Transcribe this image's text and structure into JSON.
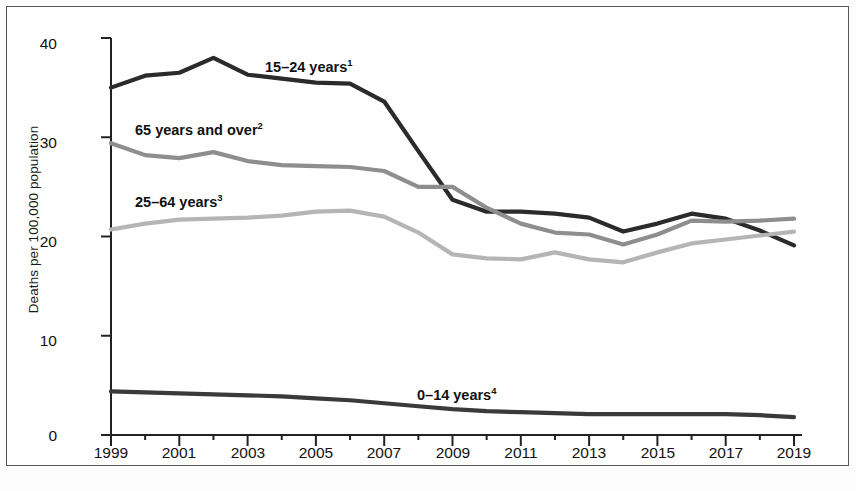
{
  "figure": {
    "background_color": "#ffffff",
    "border_color": "#555555"
  },
  "axis": {
    "ylabel": "Deaths per 100,000 population",
    "y_ticks": [
      "0",
      "10",
      "20",
      "30",
      "40"
    ],
    "x_ticks_labeled": [
      "1999",
      "2001",
      "2003",
      "2005",
      "2007",
      "2009",
      "2011",
      "2013",
      "2015",
      "2017",
      "2019"
    ]
  },
  "annotations": {
    "a1": {
      "text": "15–24 years",
      "sup": "1"
    },
    "a2": {
      "text": "65 years and over",
      "sup": "2"
    },
    "a3": {
      "text": "25–64 years",
      "sup": "3"
    },
    "a4": {
      "text": "0–14 years",
      "sup": "4"
    }
  },
  "chart_data": {
    "type": "line",
    "title": "",
    "xlabel": "",
    "ylabel": "Deaths per 100,000 population",
    "xlim": [
      1999,
      2019
    ],
    "ylim": [
      0,
      40
    ],
    "ytick_values": [
      0,
      10,
      20,
      30,
      40
    ],
    "xtick_values": [
      1999,
      2000,
      2001,
      2002,
      2003,
      2004,
      2005,
      2006,
      2007,
      2008,
      2009,
      2010,
      2011,
      2012,
      2013,
      2014,
      2015,
      2016,
      2017,
      2018,
      2019
    ],
    "xtick_labels_shown": [
      1999,
      2001,
      2003,
      2005,
      2007,
      2009,
      2011,
      2013,
      2015,
      2017,
      2019
    ],
    "grid": false,
    "legend_position": "inline-annotations",
    "x": [
      1999,
      2000,
      2001,
      2002,
      2003,
      2004,
      2005,
      2006,
      2007,
      2008,
      2009,
      2010,
      2011,
      2012,
      2013,
      2014,
      2015,
      2016,
      2017,
      2018,
      2019
    ],
    "series": [
      {
        "name": "15–24 years",
        "footnote": "1",
        "color": "#2b2b2b",
        "values": [
          35.0,
          36.2,
          36.5,
          38.0,
          36.3,
          35.9,
          35.5,
          35.4,
          33.6,
          28.6,
          23.7,
          22.5,
          22.5,
          22.3,
          21.9,
          20.5,
          21.3,
          22.3,
          21.8,
          20.6,
          19.1
        ]
      },
      {
        "name": "65 years and over",
        "footnote": "2",
        "color": "#8e8e8e",
        "values": [
          29.4,
          28.2,
          27.9,
          28.5,
          27.6,
          27.2,
          27.1,
          27.0,
          26.6,
          25.0,
          25.0,
          22.9,
          21.3,
          20.4,
          20.2,
          19.2,
          20.2,
          21.6,
          21.5,
          21.6,
          21.8
        ]
      },
      {
        "name": "25–64 years",
        "footnote": "3",
        "color": "#b5b5b5",
        "values": [
          20.7,
          21.3,
          21.7,
          21.8,
          21.9,
          22.1,
          22.5,
          22.6,
          22.0,
          20.4,
          18.2,
          17.8,
          17.7,
          18.4,
          17.7,
          17.4,
          18.4,
          19.3,
          19.7,
          20.1,
          20.5
        ]
      },
      {
        "name": "0–14 years",
        "footnote": "4",
        "color": "#3a3a3a",
        "values": [
          4.4,
          4.3,
          4.2,
          4.1,
          4.0,
          3.9,
          3.7,
          3.5,
          3.2,
          2.9,
          2.6,
          2.4,
          2.3,
          2.2,
          2.1,
          2.1,
          2.1,
          2.1,
          2.1,
          2.0,
          1.8
        ]
      }
    ]
  }
}
